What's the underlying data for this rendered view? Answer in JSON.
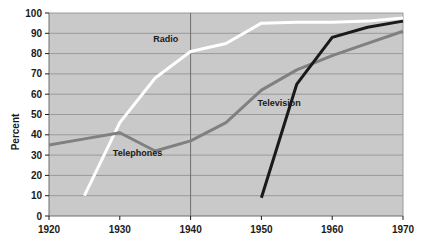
{
  "chart_data": {
    "type": "line",
    "title": "",
    "subtitle": "",
    "xlabel": "",
    "ylabel": "Percent",
    "xlim": [
      1920,
      1970
    ],
    "ylim": [
      0,
      100
    ],
    "grid": "horizontal-and-1940-vertical",
    "legend_position": "inline-labels",
    "x_ticks": [
      "1920",
      "1930",
      "1940",
      "1950",
      "1960",
      "1970"
    ],
    "x_tick_values": [
      1920,
      1930,
      1940,
      1950,
      1960,
      1970
    ],
    "y_ticks": [
      "0",
      "10",
      "20",
      "30",
      "40",
      "50",
      "60",
      "70",
      "80",
      "90",
      "100"
    ],
    "y_tick_values": [
      0,
      10,
      20,
      30,
      40,
      50,
      60,
      70,
      80,
      90,
      100
    ],
    "plot_background": "#c9c9c9",
    "series": [
      {
        "name": "Radio",
        "color": "#ffffff",
        "label_text": "Radio",
        "label_x": 1936.5,
        "label_y": 85.5,
        "x": [
          1925,
          1930,
          1935,
          1940,
          1945,
          1950,
          1955,
          1960,
          1965,
          1970
        ],
        "values": [
          10,
          46,
          68,
          81,
          85,
          95,
          95.5,
          95.5,
          96,
          97.5
        ]
      },
      {
        "name": "Telephones",
        "color": "#808080",
        "label_text": "Telephones",
        "label_x": 1932.5,
        "label_y": 29.5,
        "x": [
          1920,
          1925,
          1930,
          1935,
          1940,
          1945,
          1950,
          1955,
          1960,
          1965,
          1970
        ],
        "values": [
          35,
          38,
          41,
          32,
          37,
          46,
          62,
          72,
          79,
          85,
          91
        ]
      },
      {
        "name": "Television",
        "color": "#1a1a1a",
        "label_text": "Television",
        "label_x": 1952.5,
        "label_y": 54,
        "x": [
          1950,
          1955,
          1960,
          1965,
          1970
        ],
        "values": [
          9,
          65,
          88,
          93,
          96
        ]
      }
    ]
  }
}
